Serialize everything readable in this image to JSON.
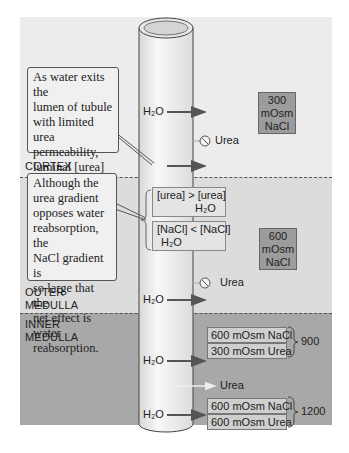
{
  "zones": {
    "cortex": "CORTEX",
    "outer_medulla": [
      "OUTER",
      "MEDULLA"
    ],
    "inner_medulla": [
      "INNER",
      "MEDULLA"
    ]
  },
  "callouts": {
    "top": [
      "As water exits the",
      "lumen of tubule",
      "with limited urea",
      "permeability,",
      "luminal [urea]",
      "increases."
    ],
    "middle": [
      "Although the",
      "urea gradient",
      "opposes water",
      "reabsorption, the",
      "NaCl gradient is",
      "so large that the",
      "net effect is water",
      "reabsorption."
    ]
  },
  "osm_boxes": {
    "cortex": [
      "300",
      "mOsm",
      "NaCl"
    ],
    "outer": [
      "600",
      "mOsm",
      "NaCl"
    ]
  },
  "gradient_boxes": {
    "urea_line": "[urea] > [urea]",
    "urea_h2o": "H₂O",
    "nacl_line": "[NaCl] < [NaCl]",
    "nacl_h2o": "H₂O"
  },
  "labels": {
    "water": "H₂O",
    "urea": "Urea"
  },
  "inner_boxes": {
    "group1": {
      "nacl": "600 mOsm NaCl",
      "urea": "300 mOsm Urea",
      "total": "900"
    },
    "group2": {
      "nacl": "600 mOsm NaCl",
      "urea": "600 mOsm Urea",
      "total": "1200"
    }
  },
  "colors": {
    "cortex_bg": "#ececec",
    "outer_medulla_bg": "#dcdcdc",
    "inner_medulla_bg": "#a8a8a8",
    "osm_box": "#9c9c9c",
    "arrow": "#555555"
  }
}
